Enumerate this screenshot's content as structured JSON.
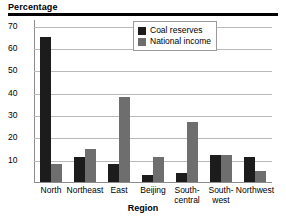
{
  "chart_data": {
    "type": "bar",
    "title": "",
    "ylabel": "Percentage",
    "xlabel": "Region",
    "categories": [
      "North",
      "Northeast",
      "East",
      "Beijing",
      "South-central",
      "South-west",
      "Northwest"
    ],
    "category_lines": [
      [
        "North"
      ],
      [
        "Northeast"
      ],
      [
        "East"
      ],
      [
        "Beijing"
      ],
      [
        "South-",
        "central"
      ],
      [
        "South-",
        "west"
      ],
      [
        "Northwest"
      ]
    ],
    "series": [
      {
        "name": "Coal reserves",
        "values": [
          65,
          11,
          8,
          3,
          4,
          12,
          11
        ]
      },
      {
        "name": "National income",
        "values": [
          8,
          15,
          38,
          11,
          27,
          12,
          5
        ]
      }
    ],
    "yticks": [
      70,
      60,
      50,
      40,
      30,
      20,
      10
    ],
    "ylim": [
      0,
      73
    ],
    "grid": true,
    "legend_position": "top-right",
    "colors": {
      "coal_reserves": "#1c1c1c",
      "national_income": "#6e6e6e",
      "gridline": "#b9b9b9",
      "axis": "#8d8d8d",
      "rule": "#000000"
    }
  }
}
